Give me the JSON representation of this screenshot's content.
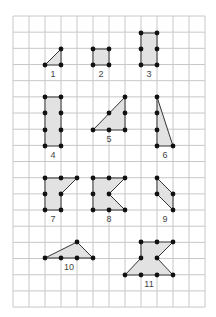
{
  "grid": {
    "left": 13,
    "top": 16,
    "cols": 12,
    "rows": 18,
    "cell_w": 16,
    "cell_h": 16.17,
    "line_color": "#c8c8c8"
  },
  "colors": {
    "fill": "#e2e2e2",
    "stroke": "#333333",
    "dot": "#111111"
  },
  "shapes": [
    {
      "label": "1",
      "points": [
        [
          45,
          65
        ],
        [
          61,
          49
        ],
        [
          61,
          65
        ]
      ],
      "dots": [
        [
          45,
          65
        ],
        [
          61,
          49
        ],
        [
          61,
          65
        ]
      ],
      "label_pos": [
        53,
        77
      ]
    },
    {
      "label": "2",
      "points": [
        [
          93,
          49
        ],
        [
          109,
          49
        ],
        [
          109,
          65
        ],
        [
          93,
          65
        ]
      ],
      "dots": [
        [
          93,
          49
        ],
        [
          109,
          49
        ],
        [
          109,
          65
        ],
        [
          93,
          65
        ]
      ],
      "label_pos": [
        101,
        77
      ]
    },
    {
      "label": "3",
      "points": [
        [
          141,
          33
        ],
        [
          157,
          33
        ],
        [
          157,
          65
        ],
        [
          141,
          65
        ]
      ],
      "dots": [
        [
          141,
          33
        ],
        [
          157,
          33
        ],
        [
          141,
          49
        ],
        [
          157,
          49
        ],
        [
          141,
          65
        ],
        [
          157,
          65
        ]
      ],
      "label_pos": [
        149,
        77
      ]
    },
    {
      "label": "4",
      "points": [
        [
          45,
          97
        ],
        [
          61,
          97
        ],
        [
          61,
          146
        ],
        [
          45,
          146
        ]
      ],
      "dots": [
        [
          45,
          97
        ],
        [
          61,
          97
        ],
        [
          45,
          113
        ],
        [
          61,
          113
        ],
        [
          45,
          130
        ],
        [
          61,
          130
        ],
        [
          45,
          146
        ],
        [
          61,
          146
        ]
      ],
      "label_pos": [
        53,
        158
      ]
    },
    {
      "label": "5",
      "points": [
        [
          93,
          130
        ],
        [
          125,
          97
        ],
        [
          125,
          130
        ]
      ],
      "dots": [
        [
          93,
          130
        ],
        [
          109,
          130
        ],
        [
          125,
          130
        ],
        [
          125,
          113
        ],
        [
          125,
          97
        ],
        [
          109,
          113
        ]
      ],
      "label_pos": [
        109,
        142
      ]
    },
    {
      "label": "6",
      "points": [
        [
          157,
          97
        ],
        [
          173,
          146
        ],
        [
          157,
          146
        ]
      ],
      "dots": [
        [
          157,
          97
        ],
        [
          157,
          113
        ],
        [
          157,
          130
        ],
        [
          157,
          146
        ],
        [
          173,
          146
        ]
      ],
      "label_pos": [
        165,
        158
      ]
    },
    {
      "label": "7",
      "points": [
        [
          45,
          178
        ],
        [
          77,
          178
        ],
        [
          61,
          194
        ],
        [
          61,
          210
        ],
        [
          45,
          210
        ]
      ],
      "dots": [
        [
          45,
          178
        ],
        [
          61,
          178
        ],
        [
          77,
          178
        ],
        [
          45,
          194
        ],
        [
          61,
          194
        ],
        [
          45,
          210
        ],
        [
          61,
          210
        ]
      ],
      "label_pos": [
        53,
        222
      ]
    },
    {
      "label": "8",
      "points": [
        [
          93,
          178
        ],
        [
          125,
          178
        ],
        [
          109,
          194
        ],
        [
          125,
          210
        ],
        [
          93,
          210
        ]
      ],
      "dots": [
        [
          93,
          178
        ],
        [
          109,
          178
        ],
        [
          125,
          178
        ],
        [
          93,
          194
        ],
        [
          109,
          194
        ],
        [
          93,
          210
        ],
        [
          109,
          210
        ],
        [
          125,
          210
        ]
      ],
      "label_pos": [
        109,
        222
      ]
    },
    {
      "label": "9",
      "points": [
        [
          157,
          178
        ],
        [
          173,
          194
        ],
        [
          173,
          210
        ],
        [
          157,
          194
        ]
      ],
      "dots": [
        [
          157,
          178
        ],
        [
          157,
          194
        ],
        [
          173,
          194
        ],
        [
          173,
          210
        ]
      ],
      "label_pos": [
        165,
        222
      ]
    },
    {
      "label": "10",
      "points": [
        [
          45,
          258
        ],
        [
          77,
          242
        ],
        [
          93,
          258
        ]
      ],
      "dots": [
        [
          45,
          258
        ],
        [
          61,
          258
        ],
        [
          77,
          258
        ],
        [
          93,
          258
        ],
        [
          77,
          242
        ]
      ],
      "label_pos": [
        69,
        270
      ]
    },
    {
      "label": "11",
      "points": [
        [
          141,
          242
        ],
        [
          173,
          242
        ],
        [
          157,
          258
        ],
        [
          173,
          275
        ],
        [
          125,
          275
        ],
        [
          141,
          258
        ]
      ],
      "dots": [
        [
          141,
          242
        ],
        [
          157,
          242
        ],
        [
          173,
          242
        ],
        [
          141,
          258
        ],
        [
          157,
          258
        ],
        [
          125,
          275
        ],
        [
          141,
          275
        ],
        [
          157,
          275
        ],
        [
          173,
          275
        ]
      ],
      "label_pos": [
        149,
        287
      ]
    }
  ]
}
